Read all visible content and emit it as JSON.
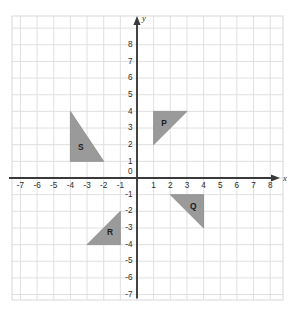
{
  "chart_data": {
    "type": "scatter",
    "title": "",
    "xlabel": "x",
    "ylabel": "y",
    "grid": true,
    "legend": "none",
    "xlim": [
      -7.5,
      8.75
    ],
    "ylim": [
      -7.3,
      8.4
    ],
    "x_ticks": [
      -7,
      -6,
      -5,
      -4,
      -3,
      -2,
      -1,
      0,
      1,
      2,
      3,
      4,
      5,
      6,
      7,
      8
    ],
    "y_ticks": [
      -7,
      -6,
      -5,
      -4,
      -3,
      -2,
      -1,
      0,
      1,
      2,
      3,
      4,
      5,
      6,
      7,
      8
    ],
    "x_tick_labels": [
      "-7",
      "-6",
      "-5",
      "-4",
      "-3",
      "-2",
      "-1",
      "0",
      "1",
      "2",
      "3",
      "4",
      "5",
      "6",
      "7",
      "8"
    ],
    "y_tick_labels": [
      "-7",
      "-6",
      "-5",
      "-4",
      "-3",
      "-2",
      "-1",
      "0",
      "1",
      "2",
      "3",
      "4",
      "5",
      "6",
      "7",
      "8"
    ],
    "origin_label": "0",
    "shapes": [
      {
        "name": "P",
        "label": "P",
        "kind": "right-triangle",
        "fill": "#9a9a9a",
        "vertices": [
          [
            1,
            4
          ],
          [
            3,
            4
          ],
          [
            1,
            2
          ]
        ],
        "label_point": [
          1.62,
          3.28
        ],
        "quadrant": "I"
      },
      {
        "name": "Q",
        "label": "Q",
        "kind": "right-triangle",
        "fill": "#9a9a9a",
        "vertices": [
          [
            2,
            -1
          ],
          [
            4,
            -1
          ],
          [
            4,
            -3
          ]
        ],
        "label_point": [
          3.38,
          -1.72
        ],
        "quadrant": "IV"
      },
      {
        "name": "R",
        "label": "R",
        "kind": "right-triangle",
        "fill": "#9a9a9a",
        "vertices": [
          [
            -1,
            -2
          ],
          [
            -1,
            -4
          ],
          [
            -3,
            -4
          ]
        ],
        "label_point": [
          -1.62,
          -3.28
        ],
        "quadrant": "III"
      },
      {
        "name": "S",
        "label": "S",
        "kind": "right-triangle",
        "fill": "#9a9a9a",
        "vertices": [
          [
            -4,
            4
          ],
          [
            -4,
            1
          ],
          [
            -2,
            1
          ]
        ],
        "label_point": [
          -3.38,
          1.82
        ],
        "quadrant": "II"
      }
    ],
    "axis_colors": {
      "axis": "#3a3a3a",
      "grid_minor": "#e8e8e8",
      "grid_major": "#dcdcdc",
      "frame": "#d8d8d8",
      "shape_fill": "#9a9a9a",
      "text": "#2b2b2b"
    }
  }
}
